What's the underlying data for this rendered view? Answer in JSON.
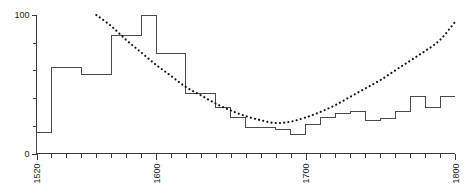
{
  "chart_data": {
    "type": "bar",
    "title": "",
    "subtitle": "",
    "xlabel": "",
    "ylabel": "",
    "xlim": [
      1520,
      1800
    ],
    "ylim": [
      0,
      100
    ],
    "grid": false,
    "legend": null,
    "x_tick_labels": [
      "1520",
      "1600",
      "1700",
      "1800"
    ],
    "x_tick_values": [
      1520,
      1600,
      1700,
      1800
    ],
    "x_minor_tick_step": 10,
    "y_tick_labels": [
      "0",
      "100"
    ],
    "y_tick_values": [
      0,
      100
    ],
    "y_minor_tick_values": [
      20,
      40,
      60,
      80
    ],
    "series": [
      {
        "name": "decadal-step",
        "render": "step",
        "categories": [
          1520,
          1530,
          1540,
          1550,
          1560,
          1570,
          1580,
          1590,
          1600,
          1610,
          1620,
          1630,
          1640,
          1650,
          1660,
          1670,
          1680,
          1690,
          1700,
          1710,
          1720,
          1730,
          1740,
          1750,
          1760,
          1770,
          1780,
          1790
        ],
        "values": [
          15,
          62,
          62,
          57,
          57,
          85,
          85,
          100,
          72,
          72,
          43,
          43,
          33,
          26,
          19,
          19,
          17,
          14,
          21,
          26,
          29,
          30,
          24,
          25,
          30,
          41,
          33,
          41
        ]
      },
      {
        "name": "trend-curve",
        "render": "dotted-line",
        "x": [
          1560,
          1570,
          1580,
          1590,
          1600,
          1610,
          1620,
          1630,
          1640,
          1650,
          1660,
          1670,
          1680,
          1690,
          1700,
          1710,
          1720,
          1730,
          1740,
          1750,
          1760,
          1770,
          1780,
          1790,
          1800
        ],
        "values": [
          100,
          92,
          82,
          73,
          64,
          56,
          48,
          42,
          36,
          31,
          27,
          24,
          22,
          23,
          26,
          30,
          35,
          41,
          47,
          53,
          60,
          67,
          74,
          82,
          95
        ]
      }
    ]
  },
  "axes": {
    "y_top_label": "100",
    "y_zero_label": "0",
    "x_labels": [
      "1520",
      "1600",
      "1700",
      "1800"
    ]
  },
  "colors": {
    "axis": "#3a3a3a",
    "step_line": "#4a4a4a",
    "trend_dots": "#111111",
    "background": "#ffffff",
    "text": "#1a1a1a"
  }
}
